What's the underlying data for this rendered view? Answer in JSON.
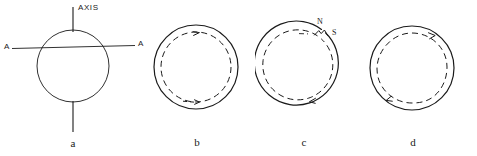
{
  "figure": {
    "background_color": "#ffffff",
    "line_color": "#1a1a1a",
    "panels": [
      {
        "id": "a",
        "caption": "a",
        "kind": "sphere-with-rotation-axis",
        "labels": {
          "axis": "AXIS",
          "equator_left": "A",
          "equator_right": "A"
        },
        "elements": [
          "solid-outer-circle",
          "vertical-axis-line",
          "horizontal-equator-line"
        ]
      },
      {
        "id": "b",
        "caption": "b",
        "kind": "concentric-solid-and-dashed-circle",
        "labels": {},
        "elements": [
          "solid-outer-circle",
          "dashed-inner-circle",
          "clockwise-arrowhead-top"
        ]
      },
      {
        "id": "c",
        "caption": "c",
        "kind": "concentric-circles-with-pole-break",
        "labels": {
          "north_pole": "N",
          "south_pole": "S"
        },
        "elements": [
          "solid-outer-circle-with-break",
          "dashed-inner-circle",
          "pole-reconnection-kink",
          "clockwise-arrowhead-bottom"
        ]
      },
      {
        "id": "d",
        "caption": "d",
        "kind": "concentric-circles-distorted",
        "labels": {},
        "elements": [
          "solid-outer-circle",
          "dashed-inner-circle-distorted",
          "clockwise-arrowhead-top-right",
          "clockwise-arrowhead-bottom-left"
        ]
      }
    ]
  }
}
